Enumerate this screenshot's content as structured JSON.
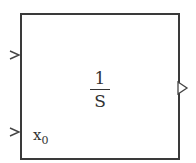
{
  "block": {
    "type": "Integrator",
    "border_color": "#3a3a3a",
    "text_color": "#333333",
    "background": "#ffffff"
  },
  "transfer_function": {
    "numerator": "1",
    "denominator": "S"
  },
  "ports": {
    "inputs": [
      {
        "name": "input-1",
        "label": ""
      },
      {
        "name": "initial-condition",
        "label": "x",
        "subscript": "0"
      }
    ],
    "outputs": [
      {
        "name": "output-1",
        "label": ""
      }
    ]
  }
}
